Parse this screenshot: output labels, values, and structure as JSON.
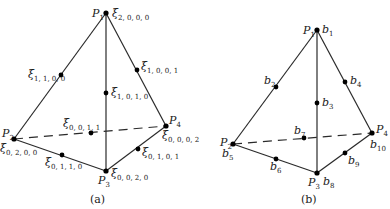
{
  "figure_a": {
    "caption": "(a)",
    "vertices": [
      {
        "name": "P",
        "sub": "1",
        "x": 106,
        "y": 13,
        "coef": "ξ",
        "coef_sub": "3,0,0,0"
      },
      {
        "name": "P",
        "sub": "2",
        "x": 14,
        "y": 139,
        "coef": "ξ",
        "coef_sub": "0,3,0,0"
      },
      {
        "name": "P",
        "sub": "3",
        "x": 106,
        "y": 171,
        "coef": "ξ",
        "coef_sub": "0,0,3,0"
      },
      {
        "name": "P",
        "sub": "4",
        "x": 166,
        "y": 126,
        "coef": "ξ",
        "coef_sub": "0,0,0,3"
      }
    ],
    "edge_points": [
      {
        "label": "ξ",
        "sub": "2,1,0,0",
        "x": 61,
        "y": 75
      },
      {
        "label": "ξ",
        "sub": "2,0,0,1",
        "x": 137,
        "y": 70
      },
      {
        "label": "ξ",
        "sub": "2,0,1,0",
        "x": 106,
        "y": 93
      },
      {
        "label": "ξ",
        "sub": "0,0,2,1",
        "x": 91,
        "y": 133
      },
      {
        "label": "ξ",
        "sub": "0,2,1,0",
        "x": 62,
        "y": 155
      },
      {
        "label": "ξ",
        "sub": "0,1,2,1",
        "x": 138,
        "y": 149
      }
    ],
    "labels": {
      "p1": "P",
      "p1_sub": "1",
      "xi_top": "ξ",
      "xi_top_sub": "2, 0, 0, 0",
      "xi_1100": "ξ",
      "xi_1100_sub": "1, 1, 0, 0",
      "xi_1001": "ξ",
      "xi_1001_sub": "1, 0, 0, 1",
      "xi_1010": "ξ",
      "xi_1010_sub": "1, 0, 1, 0",
      "xi_0011": "ξ",
      "xi_0011_sub": "0, 0, 1, 1",
      "p2": "P",
      "p2_sub": "2",
      "xi_0200": "ξ",
      "xi_0200_sub": "0, 2, 0, 0",
      "p4": "P",
      "p4_sub": "4",
      "xi_0002": "ξ",
      "xi_0002_sub": "0, 0, 0, 2",
      "xi_0110": "ξ",
      "xi_0110_sub": "0, 1, 1, 0",
      "xi_0101": "ξ",
      "xi_0101_sub": "0, 1, 0, 1",
      "p3": "P",
      "p3_sub": "3",
      "xi_0020": "ξ",
      "xi_0020_sub": "0, 0, 2, 0"
    }
  },
  "figure_b": {
    "caption": "(b)",
    "labels": {
      "p1": "P",
      "p1_sub": "1",
      "b1": "b",
      "b1_sub": "1",
      "b2": "b",
      "b2_sub": "2",
      "b3": "b",
      "b3_sub": "3",
      "b4": "b",
      "b4_sub": "4",
      "p2": "P",
      "p2_sub": "2",
      "b5": "b",
      "b5_sub": "5",
      "b6": "b",
      "b6_sub": "6",
      "b7": "b",
      "b7_sub": "7",
      "p3": "P",
      "p3_sub": "3",
      "b8": "b",
      "b8_sub": "8",
      "b9": "b",
      "b9_sub": "9",
      "p4": "P",
      "p4_sub": "4",
      "b10": "b",
      "b10_sub": "10"
    }
  },
  "style": {
    "line_color": "#2a2a2a",
    "dot_color": "#000000",
    "background": "#ffffff"
  }
}
